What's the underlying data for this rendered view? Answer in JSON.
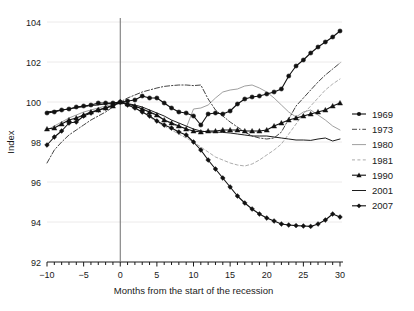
{
  "chart_data": {
    "type": "line",
    "title": "",
    "xlabel": "Months from the start of the recession",
    "ylabel": "Index",
    "xlim": [
      -10,
      30
    ],
    "ylim": [
      92,
      104
    ],
    "xticks": [
      -10,
      -5,
      0,
      5,
      10,
      15,
      20,
      25,
      30
    ],
    "xtick_labels": [
      "−10",
      "−5",
      "0",
      "5",
      "10",
      "15",
      "20",
      "25",
      "30"
    ],
    "yticks": [
      92,
      94,
      96,
      98,
      100,
      102,
      104
    ],
    "ytick_labels": [
      "92",
      "94",
      "96",
      "98",
      "100",
      "102",
      "104"
    ],
    "minor_xtick_step": 1,
    "grid": "horizontal-light",
    "legend_position": "right",
    "reference_line_x": 0,
    "x": [
      -10,
      -9,
      -8,
      -7,
      -6,
      -5,
      -4,
      -3,
      -2,
      -1,
      0,
      1,
      2,
      3,
      4,
      5,
      6,
      7,
      8,
      9,
      10,
      11,
      12,
      13,
      14,
      15,
      16,
      17,
      18,
      19,
      20,
      21,
      22,
      23,
      24,
      25,
      26,
      27,
      28,
      29,
      30
    ],
    "series": [
      {
        "name": "1969",
        "color": "#111111",
        "style": "solid",
        "marker": "circle",
        "values": [
          99.45,
          99.5,
          99.6,
          99.65,
          99.75,
          99.8,
          99.85,
          99.95,
          99.95,
          99.95,
          100.0,
          100.05,
          100.1,
          100.3,
          100.2,
          100.2,
          99.95,
          99.7,
          99.5,
          99.45,
          99.3,
          98.85,
          99.4,
          99.45,
          99.4,
          99.55,
          99.9,
          100.15,
          100.25,
          100.3,
          100.4,
          100.5,
          100.65,
          101.3,
          101.8,
          102.1,
          102.45,
          102.75,
          103.0,
          103.25,
          103.55
        ]
      },
      {
        "name": "1973",
        "color": "#3a3a3a",
        "style": "dashdot",
        "marker": "none",
        "values": [
          96.95,
          97.6,
          98.0,
          98.35,
          98.6,
          98.85,
          99.1,
          99.3,
          99.5,
          99.75,
          100.0,
          100.2,
          100.35,
          100.5,
          100.6,
          100.7,
          100.78,
          100.82,
          100.85,
          100.85,
          100.82,
          100.85,
          100.15,
          99.6,
          99.3,
          99.0,
          98.75,
          98.5,
          98.3,
          98.2,
          98.15,
          98.2,
          98.5,
          99.15,
          99.8,
          100.2,
          100.6,
          101.0,
          101.35,
          101.65,
          101.95
        ]
      },
      {
        "name": "1980",
        "color": "#9a9a9a",
        "style": "solid",
        "marker": "none",
        "values": [
          98.6,
          98.8,
          99.0,
          99.2,
          99.35,
          99.5,
          99.6,
          99.7,
          99.8,
          99.9,
          100.0,
          99.9,
          99.8,
          99.65,
          99.5,
          99.3,
          99.1,
          98.9,
          98.75,
          98.7,
          99.65,
          99.7,
          99.85,
          100.2,
          100.5,
          100.6,
          100.65,
          100.8,
          100.85,
          100.7,
          100.5,
          100.2,
          99.85,
          99.5,
          99.25,
          99.5,
          99.6,
          99.35,
          99.1,
          98.8,
          98.6
        ]
      },
      {
        "name": "1981",
        "color": "#a8a8a8",
        "style": "dashed",
        "marker": "none",
        "values": [
          99.5,
          99.55,
          99.6,
          99.65,
          99.7,
          99.75,
          99.8,
          99.85,
          99.9,
          99.95,
          100.0,
          99.85,
          99.7,
          99.5,
          99.25,
          99.0,
          98.8,
          98.6,
          98.4,
          98.2,
          98.0,
          97.75,
          97.5,
          97.25,
          97.1,
          96.95,
          96.85,
          96.8,
          96.9,
          97.1,
          97.35,
          97.6,
          97.9,
          98.4,
          98.9,
          99.4,
          99.8,
          100.2,
          100.6,
          100.9,
          101.15
        ]
      },
      {
        "name": "1990",
        "color": "#111111",
        "style": "solid",
        "marker": "triangle",
        "values": [
          98.65,
          98.7,
          98.9,
          99.1,
          99.2,
          99.35,
          99.5,
          99.6,
          99.7,
          99.8,
          100.0,
          99.9,
          99.8,
          99.65,
          99.5,
          99.35,
          99.1,
          98.95,
          98.8,
          98.65,
          98.55,
          98.5,
          98.55,
          98.55,
          98.6,
          98.6,
          98.6,
          98.55,
          98.55,
          98.55,
          98.6,
          98.8,
          98.95,
          99.1,
          99.2,
          99.3,
          99.4,
          99.5,
          99.6,
          99.8,
          99.95
        ]
      },
      {
        "name": "2001",
        "color": "#111111",
        "style": "solid",
        "marker": "none",
        "values": [
          99.5,
          99.55,
          99.6,
          99.65,
          99.72,
          99.78,
          99.82,
          99.86,
          99.9,
          99.95,
          100.0,
          99.92,
          99.85,
          99.75,
          99.6,
          99.45,
          99.3,
          99.1,
          98.95,
          98.8,
          98.65,
          98.55,
          98.5,
          98.5,
          98.48,
          98.45,
          98.4,
          98.35,
          98.3,
          98.3,
          98.3,
          98.25,
          98.2,
          98.15,
          98.1,
          98.1,
          98.08,
          98.15,
          98.2,
          98.05,
          98.15
        ]
      },
      {
        "name": "2007",
        "color": "#111111",
        "style": "solid",
        "marker": "diamond",
        "values": [
          97.85,
          98.25,
          98.55,
          98.95,
          99.0,
          99.3,
          99.45,
          99.6,
          99.7,
          99.85,
          100.0,
          99.85,
          99.7,
          99.5,
          99.3,
          99.05,
          98.85,
          98.7,
          98.5,
          98.35,
          98.0,
          97.6,
          97.1,
          96.65,
          96.2,
          95.75,
          95.3,
          94.95,
          94.65,
          94.4,
          94.2,
          94.05,
          93.9,
          93.85,
          93.82,
          93.8,
          93.78,
          93.9,
          94.1,
          94.4,
          94.25
        ]
      }
    ]
  }
}
